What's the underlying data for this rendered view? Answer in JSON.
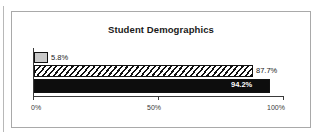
{
  "chart_data": {
    "type": "bar",
    "orientation": "horizontal",
    "title": "Student Demographics",
    "xlabel": "",
    "ylabel": "",
    "xlim": [
      0,
      100
    ],
    "grid": false,
    "legend": false,
    "axis_tick_labels": [
      "0%",
      "50%",
      "100%"
    ],
    "axis_tick_values": [
      0,
      50,
      100
    ],
    "categories": [
      "series-1",
      "series-2",
      "series-3"
    ],
    "values": [
      5.8,
      87.7,
      94.2
    ],
    "data_labels": [
      "5.8%",
      "87.7%",
      "94.2%"
    ],
    "bar_styles": [
      "solid-light-gray",
      "diagonal-hatch",
      "solid-black"
    ],
    "label_placement": [
      "outside",
      "outside",
      "inside"
    ]
  },
  "colors": {
    "panel_border": "#a9a9a9",
    "axis": "#3a3a3a",
    "bar_gray": "#c9c9c9",
    "bar_black": "#0d0d0d",
    "bar_outline": "#111111",
    "text": "#1a1a1a",
    "inside_label_text": "#ffffff",
    "background": "#ffffff"
  }
}
